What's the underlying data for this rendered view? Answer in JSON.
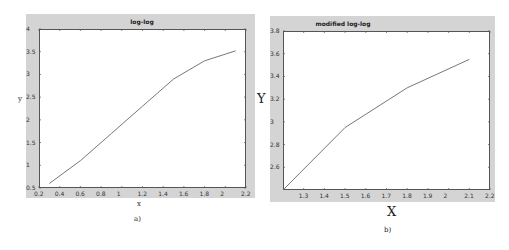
{
  "chart_data": [
    {
      "type": "line",
      "title": "log-log",
      "xlabel": "x",
      "ylabel": "y",
      "caption": "a)",
      "xlim": [
        0.2,
        2.2
      ],
      "ylim": [
        0.5,
        4
      ],
      "xticks": [
        "0.2",
        "0.4",
        "0.6",
        "0.8",
        "1",
        "1.2",
        "1.4",
        "1.6",
        "1.8",
        "2",
        "2.2"
      ],
      "yticks": [
        "0.5",
        "1",
        "1.5",
        "2",
        "2.5",
        "3",
        "3.5",
        "4"
      ],
      "grid": false,
      "series": [
        {
          "name": "log-log",
          "x": [
            0.3,
            0.6,
            0.9,
            1.2,
            1.5,
            1.8,
            2.1
          ],
          "y": [
            0.6,
            1.1,
            1.7,
            2.3,
            2.9,
            3.3,
            3.52
          ]
        }
      ]
    },
    {
      "type": "line",
      "title": "modified log-log",
      "xlabel": "X",
      "ylabel": "Y",
      "caption": "b)",
      "xlim": [
        1.2,
        2.2
      ],
      "ylim": [
        2.4,
        3.8
      ],
      "xticks": [
        "1.3",
        "1.4",
        "1.5",
        "1.6",
        "1.7",
        "1.8",
        "1.9",
        "2",
        "2.1",
        "2.2"
      ],
      "yticks": [
        "2.6",
        "2.8",
        "3",
        "3.2",
        "3.4",
        "3.6",
        "3.8"
      ],
      "grid": false,
      "series": [
        {
          "name": "modified log-log",
          "x": [
            1.2,
            1.5,
            1.8,
            2.1
          ],
          "y": [
            2.4,
            2.95,
            3.3,
            3.55
          ]
        }
      ]
    }
  ]
}
